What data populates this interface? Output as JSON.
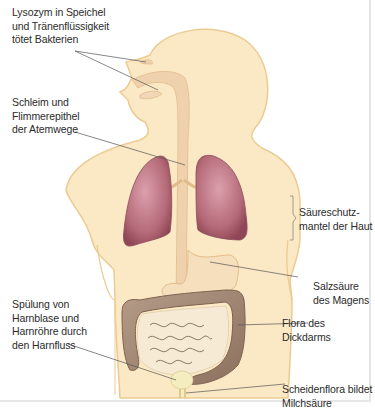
{
  "diagram": {
    "labels": [
      {
        "id": "lysozym",
        "text": "Lysozym in Speichel\nund Tränenflüssigkeit\ntötet Bakterien"
      },
      {
        "id": "schleim",
        "text": "Schleim und\nFlimmerepithel\nder Atemwege"
      },
      {
        "id": "saeureschutz",
        "text": "Säureschutz-\nmantel der Haut"
      },
      {
        "id": "salzsaeure",
        "text": "Salzsäure\ndes Magens"
      },
      {
        "id": "spuelung",
        "text": "Spülung von\nHarnblase und\nHarnröhre durch\nden Harnfluss"
      },
      {
        "id": "flora-dickdarm",
        "text": "Flora des Dickdarms"
      },
      {
        "id": "scheidenflora",
        "text": "Scheidenflora bildet\nMilchsäure"
      }
    ],
    "colors": {
      "skin": "#fbe9c6",
      "skin_outline": "#eccb92",
      "airway": "#efd2ad",
      "lung": "#b56a78",
      "lung_light": "#d99aa6",
      "colon": "#a68a74",
      "intestine": "#f3e6cf",
      "bladder": "#f4edc0",
      "leader_line": "#555555"
    }
  }
}
